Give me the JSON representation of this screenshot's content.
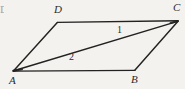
{
  "figure": {
    "type": "geometry-diagram",
    "shape": "parallelogram",
    "background_color": "#f4f2ee",
    "stroke_color": "#222222",
    "label_color": "#2b2b2b",
    "width": 185,
    "height": 89,
    "vertices": [
      {
        "name": "D",
        "label": "D",
        "x": 57,
        "y": 22
      },
      {
        "name": "C",
        "label": "C",
        "x": 178,
        "y": 21
      },
      {
        "name": "A",
        "label": "A",
        "x": 13,
        "y": 71
      },
      {
        "name": "B",
        "label": "B",
        "x": 135,
        "y": 70
      }
    ],
    "edges": [
      {
        "name": "side-DC",
        "from": "D",
        "to": "C"
      },
      {
        "name": "side-CB",
        "from": "C",
        "to": "B"
      },
      {
        "name": "side-BA",
        "from": "B",
        "to": "A"
      },
      {
        "name": "side-AD",
        "from": "A",
        "to": "D"
      },
      {
        "name": "diagonal-AC",
        "from": "A",
        "to": "C"
      }
    ],
    "angle_labels": [
      {
        "name": "angle-1",
        "label": "1",
        "x": 117,
        "y": 25,
        "at_vertex": "C"
      },
      {
        "name": "angle-2",
        "label": "2",
        "x": 69,
        "y": 52,
        "at_vertex": "A"
      }
    ],
    "edge_artifact": {
      "label": "D",
      "note": "cropped glyph at left edge"
    }
  }
}
